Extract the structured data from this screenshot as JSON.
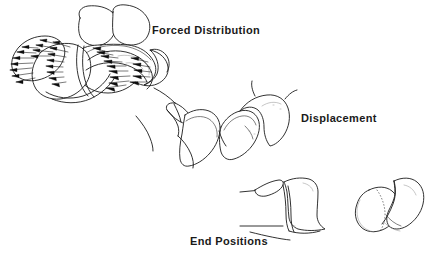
{
  "figure": {
    "title_present": false,
    "background_color": "#ffffff",
    "ink_color": "#1b1b1b",
    "text_color": "#1a1a1a",
    "width": 432,
    "height": 253,
    "style": "anatomical line drawing",
    "labels": [
      {
        "id": "forced-distribution",
        "text": "Forced Distribution",
        "x": 152,
        "y": 24
      },
      {
        "id": "displacement",
        "text": "Displacement",
        "x": 301,
        "y": 112
      },
      {
        "id": "end-positions",
        "text": "End Positions",
        "x": 190,
        "y": 235
      }
    ],
    "panels": [
      {
        "name": "forced-distribution-panel",
        "label": "Forced Distribution",
        "description": "Vertebral bodies with dense arrays of force-vector arrows radiating outward from the compressed endplate surfaces",
        "arrow_rows": 11,
        "arrow_groups": 3
      },
      {
        "name": "displacement-panel",
        "label": "Displacement",
        "description": "Fractured vertebral segments separating and shifting apart along the fracture plane"
      },
      {
        "name": "end-positions-panel",
        "label": "End Positions",
        "description": "Final resting positions of the displaced bone fragments shown in lateral and axial views"
      }
    ]
  }
}
